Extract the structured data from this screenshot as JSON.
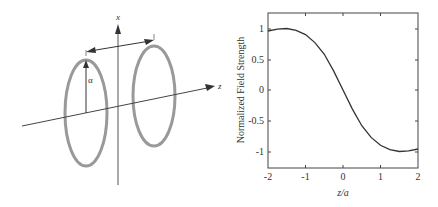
{
  "diagram": {
    "axis_x_label": "x",
    "axis_z_label": "z",
    "radius_label": "α"
  },
  "chart_data": {
    "type": "line",
    "title": "",
    "xlabel": "z/a",
    "ylabel": "Normalized Field Strength",
    "xlim": [
      -2,
      2
    ],
    "ylim": [
      -1.25,
      1.25
    ],
    "x_ticks": [
      "-2",
      "-1",
      "0",
      "1",
      "2"
    ],
    "y_ticks": [
      "1",
      "0.5",
      "0",
      "-0.5",
      "-1"
    ],
    "grid": false,
    "series": [
      {
        "name": "field",
        "x": [
          -2,
          -1.75,
          -1.5,
          -1.25,
          -1,
          -0.75,
          -0.5,
          -0.25,
          0,
          0.25,
          0.5,
          0.75,
          1,
          1.25,
          1.5,
          1.75,
          2
        ],
        "y": [
          0.96,
          0.99,
          1.0,
          0.97,
          0.9,
          0.77,
          0.58,
          0.31,
          0.0,
          -0.31,
          -0.58,
          -0.77,
          -0.9,
          -0.97,
          -1.0,
          -0.99,
          -0.96
        ]
      }
    ]
  }
}
